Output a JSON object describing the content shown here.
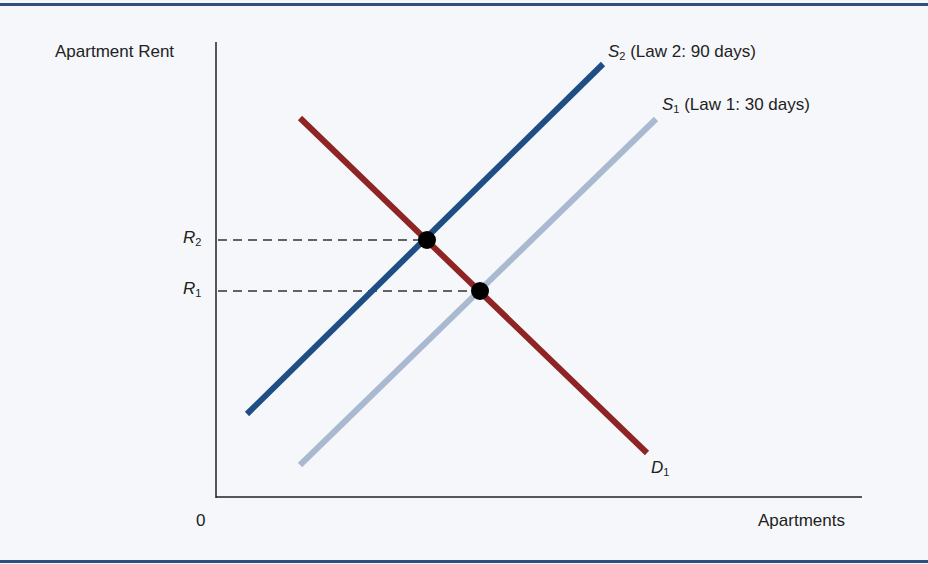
{
  "chart_data": {
    "type": "line",
    "title": "",
    "xlabel": "Apartments",
    "ylabel": "Apartment Rent",
    "origin_label": "0",
    "grid": false,
    "series": [
      {
        "name": "S2 (Law 2: 90 days)",
        "symbol": "S",
        "sub": "2",
        "desc": "(Law 2: 90 days)",
        "color": "#1f4e85",
        "points": [
          [
            247,
            414
          ],
          [
            603,
            64
          ]
        ]
      },
      {
        "name": "S1 (Law 1: 30 days)",
        "symbol": "S",
        "sub": "1",
        "desc": "(Law 1: 30 days)",
        "color": "#a9b9d0",
        "points": [
          [
            300,
            465
          ],
          [
            656,
            119
          ]
        ]
      },
      {
        "name": "D1",
        "symbol": "D",
        "sub": "1",
        "color": "#8f2424",
        "points": [
          [
            300,
            118
          ],
          [
            647,
            453
          ]
        ]
      }
    ],
    "equilibria": [
      {
        "label": "R2",
        "symbol": "R",
        "sub": "2",
        "x": 427,
        "y": 240
      },
      {
        "label": "R1",
        "symbol": "R",
        "sub": "1",
        "x": 480,
        "y": 291
      }
    ]
  }
}
